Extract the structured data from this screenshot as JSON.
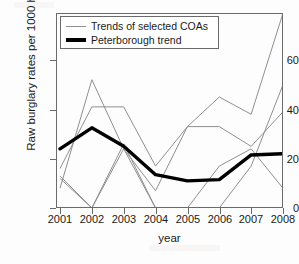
{
  "chart_data": {
    "type": "line",
    "title": "",
    "xlabel": "year",
    "ylabel": "Raw burglary rates per 1000 houses",
    "x": [
      2001,
      2002,
      2003,
      2004,
      2005,
      2006,
      2007,
      2008
    ],
    "xtick_labels": [
      "2001",
      "2002",
      "2003",
      "2004",
      "2005",
      "2006",
      "2007",
      "2008"
    ],
    "ytick_labels": [
      "0",
      "20",
      "40",
      "60"
    ],
    "ytick_values": [
      0,
      20,
      40,
      60
    ],
    "xlim": [
      2001,
      2008
    ],
    "ylim": [
      -2,
      80
    ],
    "grid": false,
    "legend_position": "top-left",
    "legend": [
      {
        "label": "Trends of selected COAs",
        "style": "thin-grey-line",
        "color": "#8f8f8f"
      },
      {
        "label": "Peterborough trend",
        "style": "thick-black-line",
        "color": "#000000"
      }
    ],
    "series": [
      {
        "name": "Peterborough trend",
        "role": "main",
        "color": "#000000",
        "width": 3.4,
        "values": [
          24,
          32.5,
          25,
          13.5,
          11,
          11.5,
          21.5,
          22
        ]
      },
      {
        "name": "COA 1",
        "role": "background",
        "color": "#8f8f8f",
        "width": 1,
        "values": [
          8,
          52,
          24,
          7,
          33,
          33,
          25,
          39
        ]
      },
      {
        "name": "COA 2",
        "role": "background",
        "color": "#8f8f8f",
        "width": 1,
        "values": [
          16,
          41,
          41,
          17,
          33,
          45,
          38,
          79
        ]
      },
      {
        "name": "COA 3",
        "role": "background",
        "color": "#8f8f8f",
        "width": 1,
        "values": [
          12,
          0,
          24,
          0,
          0,
          0,
          17,
          50
        ]
      },
      {
        "name": "COA 4",
        "role": "background",
        "color": "#8f8f8f",
        "width": 1,
        "values": [
          13,
          0,
          26,
          0,
          0,
          17,
          24,
          8
        ]
      }
    ]
  }
}
